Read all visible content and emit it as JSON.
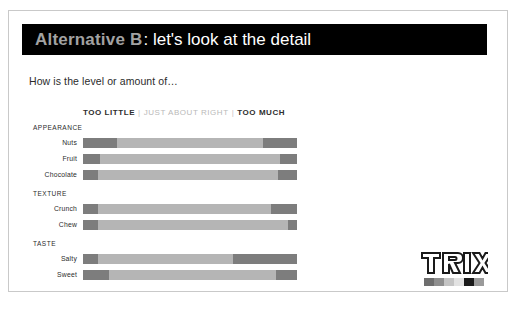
{
  "slide": {
    "title_strong": "Alternative B",
    "title_rest": ": let's look at the detail",
    "subtitle": "How is the level or amount of…"
  },
  "legend": {
    "too_little": "TOO LITTLE",
    "separator_1": "|",
    "just_about_right": "JUST ABOUT RIGHT",
    "separator_2": "|",
    "too_much": "TOO MUCH"
  },
  "sections": [
    {
      "name": "APPEARANCE"
    },
    {
      "name": "TEXTURE"
    },
    {
      "name": "TASTE"
    }
  ],
  "logo": {
    "wordmark": "TRIX",
    "swatch_colors": [
      "#6e6e6e",
      "#8f8f8f",
      "#c4c4c4",
      "#e2e2e2",
      "#1a1a1a",
      "#9a9a9a"
    ]
  },
  "colors": {
    "too_little": "#7d7d7d",
    "just_about_right": "#b5b5b5",
    "too_much": "#7d7d7d",
    "title_band": "#000000",
    "title_strong": "#a2a2a2"
  },
  "chart_data": {
    "type": "bar",
    "title": "How is the level or amount of…",
    "subtype": "stacked-horizontal-100",
    "xlabel": "",
    "ylabel": "",
    "xlim": [
      0,
      100
    ],
    "grid": false,
    "legend_position": "top",
    "legend_entries": [
      "TOO LITTLE",
      "JUST ABOUT RIGHT",
      "TOO MUCH"
    ],
    "groups": [
      {
        "name": "APPEARANCE",
        "categories": [
          "Nuts",
          "Fruit",
          "Chocolate"
        ],
        "rows": [
          {
            "category": "Nuts",
            "too_little": 16,
            "just_about_right": 68,
            "too_much": 16
          },
          {
            "category": "Fruit",
            "too_little": 8,
            "just_about_right": 84,
            "too_much": 8
          },
          {
            "category": "Chocolate",
            "too_little": 7,
            "just_about_right": 84,
            "too_much": 9
          }
        ]
      },
      {
        "name": "TEXTURE",
        "categories": [
          "Crunch",
          "Chew"
        ],
        "rows": [
          {
            "category": "Crunch",
            "too_little": 7,
            "just_about_right": 81,
            "too_much": 12
          },
          {
            "category": "Chew",
            "too_little": 7,
            "just_about_right": 89,
            "too_much": 4
          }
        ]
      },
      {
        "name": "TASTE",
        "categories": [
          "Salty",
          "Sweet"
        ],
        "rows": [
          {
            "category": "Salty",
            "too_little": 7,
            "just_about_right": 63,
            "too_much": 30
          },
          {
            "category": "Sweet",
            "too_little": 12,
            "just_about_right": 78,
            "too_much": 10
          }
        ]
      }
    ]
  }
}
